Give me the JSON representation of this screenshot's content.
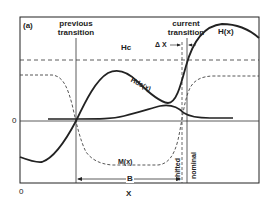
{
  "figure": {
    "panel_label": "(a)",
    "x_axis_label": "X",
    "x_origin_label": "0",
    "y_zero_label": "0",
    "colors": {
      "ink": "#222222",
      "background": "#ffffff"
    }
  },
  "markers": {
    "previous_transition": {
      "line1": "previous",
      "line2": "transition"
    },
    "current_transition": {
      "line1": "current",
      "line2": "transition"
    },
    "delta_x": "Δ X",
    "shifted": "shifted",
    "nominal": "nominal",
    "bit_length": "B"
  },
  "curves": {
    "H": {
      "label": "H(x)",
      "style": "solid-thick"
    },
    "Hds": {
      "label": "Hds(x)",
      "style": "solid-thick"
    },
    "M": {
      "label": "M(x)",
      "style": "dashed"
    },
    "Hc": {
      "label": "Hc",
      "style": "dashed-horizontal"
    }
  }
}
